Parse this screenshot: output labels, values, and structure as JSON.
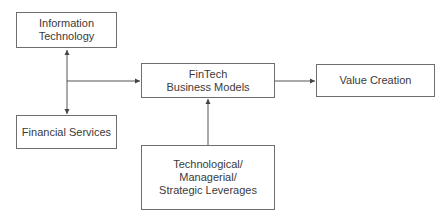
{
  "diagram": {
    "nodes": [
      {
        "id": "info_tech",
        "label": "Information\nTechnology"
      },
      {
        "id": "financial_services",
        "label": "Financial Services"
      },
      {
        "id": "fintech",
        "label": "FinTech\nBusiness Models"
      },
      {
        "id": "value_creation",
        "label": "Value Creation"
      },
      {
        "id": "leverages",
        "label": "Technological/\nManagerial/\nStrategic Leverages"
      }
    ],
    "edges": [
      {
        "from": "info_tech",
        "to": "financial_services",
        "type": "bidirectional"
      },
      {
        "from": "info_tech+financial_services",
        "to": "fintech",
        "type": "arrow"
      },
      {
        "from": "leverages",
        "to": "fintech",
        "type": "arrow"
      },
      {
        "from": "fintech",
        "to": "value_creation",
        "type": "arrow"
      }
    ],
    "colors": {
      "line": "#555555",
      "border": "#6e6e6e",
      "text": "#3a3a3a"
    }
  }
}
